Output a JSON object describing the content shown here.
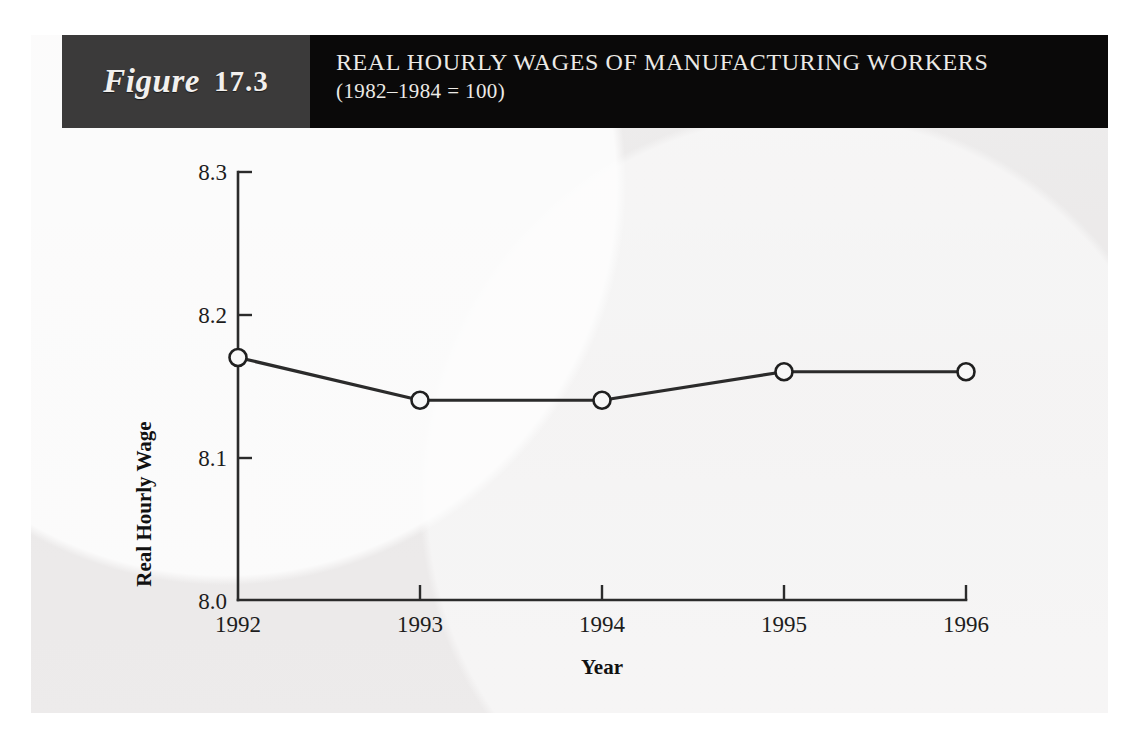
{
  "figure": {
    "label_word": "Figure",
    "number": "17.3",
    "title": "REAL HOURLY WAGES OF MANUFACTURING WORKERS",
    "subtitle": "(1982–1984 = 100)"
  },
  "colors": {
    "header_left": "#3b3a3a",
    "header_right": "#0a0909",
    "panel": "#eceaea",
    "ink": "#2b2b2b",
    "marker_fill": "#f7f7f7"
  },
  "chart_data": {
    "type": "line",
    "title": "REAL HOURLY WAGES OF MANUFACTURING WORKERS",
    "subtitle": "(1982–1984 = 100)",
    "xlabel": "Year",
    "ylabel": "Real Hourly Wage",
    "categories": [
      "1992",
      "1993",
      "1994",
      "1995",
      "1996"
    ],
    "x": [
      1992,
      1993,
      1994,
      1995,
      1996
    ],
    "values": [
      8.17,
      8.14,
      8.14,
      8.16,
      8.16
    ],
    "series": [
      {
        "name": "Real Hourly Wage",
        "values": [
          8.17,
          8.14,
          8.14,
          8.16,
          8.16
        ]
      }
    ],
    "xlim": [
      1992,
      1996
    ],
    "ylim": [
      8.0,
      8.3
    ],
    "yticks": [
      "8.0",
      "8.1",
      "8.2",
      "8.3"
    ],
    "ytick_values": [
      8.0,
      8.1,
      8.2,
      8.3
    ],
    "xticks": [
      "1992",
      "1993",
      "1994",
      "1995",
      "1996"
    ],
    "grid": false,
    "legend": false,
    "marker": "open-circle",
    "tick_direction": "in"
  }
}
